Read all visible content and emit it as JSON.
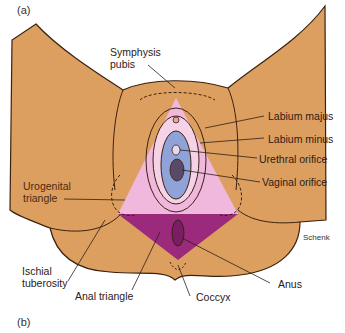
{
  "panels": {
    "top": "(a)",
    "bottom": "(b)"
  },
  "labels": {
    "symphysis_pubis_1": "Symphysis",
    "symphysis_pubis_2": "pubis",
    "labium_majus": "Labium majus",
    "labium_minus": "Labium minus",
    "urethral_orifice": "Urethral orifice",
    "vaginal_orifice": "Vaginal orifice",
    "urogenital_triangle_1": "Urogenital",
    "urogenital_triangle_2": "triangle",
    "ischial_tuberosity_1": "Ischial",
    "ischial_tuberosity_2": "tuberosity",
    "anal_triangle": "Anal triangle",
    "coccyx": "Coccyx",
    "anus": "Anus",
    "signature": "Schenk"
  },
  "colors": {
    "skin": "#dd9f5f",
    "urogenital": "#f0b8dc",
    "anal": "#9c2a7c",
    "vestibule": "#8fa3d8",
    "outline": "#3a2210"
  }
}
